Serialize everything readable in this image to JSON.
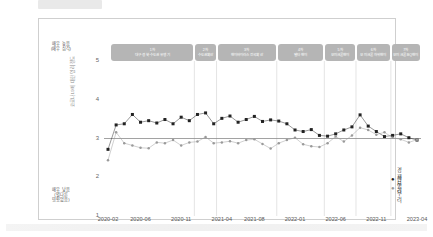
{
  "figure": {
    "frame_border_color": "#cfcfcf",
    "band_color": "#b5b5b5",
    "series_dark_color": "#222222",
    "series_light_color": "#9a9a9a"
  },
  "axis": {
    "y_top_note_line1": "매우 높음",
    "y_top_note_line2": "(매우 심각)",
    "y_bottom_note_line1": "매우 낮음",
    "y_bottom_note_line2": "(별다른",
    "y_bottom_note_line3": "영향없음)",
    "y_axis_title": "코로나19에 대한 염려 정도",
    "y_ticks": [
      "5",
      "4",
      "3",
      "2",
      "1"
    ],
    "x_ticks": [
      "2020-02",
      "2020-06",
      "2020-11",
      "2021-04",
      "2021-08",
      "2022-01",
      "2022-06",
      "2022-11",
      "2023-04"
    ]
  },
  "waves": [
    {
      "num": "1차",
      "name": "대구·경북·수도권 유행기"
    },
    {
      "num": "2차",
      "name": "수도권확산"
    },
    {
      "num": "3차",
      "name": "변이바이러스 전국확산"
    },
    {
      "num": "4차",
      "name": "델타변이"
    },
    {
      "num": "5차",
      "name": "오미크론변이"
    },
    {
      "num": "6차",
      "name": "오미크론 하위변이"
    },
    {
      "num": "7차",
      "name": "오미크론 BQ변이"
    }
  ],
  "legend": [
    {
      "marker": "●",
      "label": "경제우려",
      "color": "#222222"
    },
    {
      "marker": "●",
      "label": "감염우려",
      "color": "#9a9a9a"
    }
  ],
  "chart_data": {
    "type": "line",
    "title": "",
    "xlabel": "",
    "ylabel": "코로나19에 대한 염려 정도",
    "ylim": [
      1,
      5
    ],
    "grid": false,
    "legend_position": "right-bottom",
    "reference_line_y": 3.0,
    "x": [
      "2020-02",
      "2020-03",
      "2020-04",
      "2020-05",
      "2020-06",
      "2020-07",
      "2020-08",
      "2020-09",
      "2020-10",
      "2020-11",
      "2020-12",
      "2021-01",
      "2021-02",
      "2021-03",
      "2021-04",
      "2021-05",
      "2021-06",
      "2021-07",
      "2021-08",
      "2021-09",
      "2021-10",
      "2021-11",
      "2021-12",
      "2022-01",
      "2022-02",
      "2022-03",
      "2022-04",
      "2022-05",
      "2022-06",
      "2022-07",
      "2022-08",
      "2022-09",
      "2022-10",
      "2022-11",
      "2022-12",
      "2023-01",
      "2023-02",
      "2023-03",
      "2023-04"
    ],
    "series": [
      {
        "name": "경제우려",
        "color": "#222222",
        "marker": "square",
        "values": [
          2.72,
          3.35,
          3.38,
          3.62,
          3.42,
          3.46,
          3.4,
          3.49,
          3.38,
          3.55,
          3.46,
          3.62,
          3.66,
          3.38,
          3.52,
          3.58,
          3.42,
          3.49,
          3.57,
          3.44,
          3.48,
          3.45,
          3.38,
          3.22,
          3.18,
          3.23,
          3.08,
          3.06,
          3.12,
          3.22,
          3.3,
          3.61,
          3.32,
          3.18,
          3.05,
          3.08,
          3.12,
          3.02,
          2.96
        ]
      },
      {
        "name": "감염우려",
        "color": "#9a9a9a",
        "marker": "circle",
        "values": [
          2.44,
          3.16,
          2.88,
          2.82,
          2.76,
          2.75,
          2.9,
          2.88,
          2.96,
          2.82,
          2.9,
          2.92,
          3.04,
          2.88,
          2.9,
          2.93,
          2.88,
          2.96,
          2.98,
          2.86,
          2.74,
          2.88,
          2.96,
          3.02,
          2.85,
          2.8,
          2.78,
          2.88,
          3.05,
          2.92,
          3.08,
          3.28,
          3.22,
          3.1,
          3.16,
          3.02,
          2.98,
          2.9,
          2.97
        ]
      }
    ]
  }
}
